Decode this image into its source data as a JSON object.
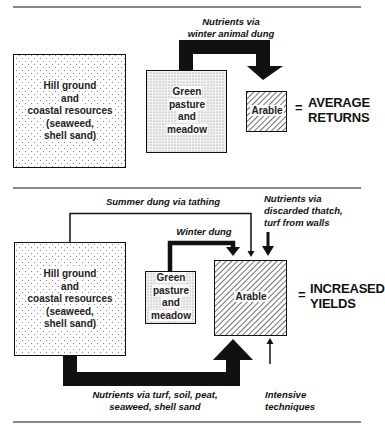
{
  "colors": {
    "ink": "#111111",
    "background": "#ffffff",
    "stipple": "#7a7a7a",
    "hatch": "#222222"
  },
  "top_panel": {
    "hill_box": {
      "lines": [
        "Hill ground",
        "and",
        "coastal resources",
        "(seaweed,",
        "shell sand)"
      ]
    },
    "pasture_box": {
      "lines": [
        "Green",
        "pasture",
        "and",
        "meadow"
      ]
    },
    "arable_box": {
      "label": "Arable"
    },
    "flow_label": {
      "lines": [
        "Nutrients via",
        "winter animal dung"
      ]
    },
    "equals": "=",
    "result": {
      "lines": [
        "AVERAGE",
        "RETURNS"
      ]
    }
  },
  "bottom_panel": {
    "hill_box": {
      "lines": [
        "Hill ground",
        "and",
        "coastal resources",
        "(seaweed,",
        "shell sand)"
      ]
    },
    "pasture_box": {
      "lines": [
        "Green",
        "pasture",
        "and",
        "meadow"
      ]
    },
    "arable_box": {
      "label": "Arable"
    },
    "summer_label": "Summer dung via tathing",
    "winter_label": "Winter dung",
    "thatch_label": {
      "lines": [
        "Nutrients via",
        "discarded thatch,",
        "turf from walls"
      ]
    },
    "turf_label": {
      "lines": [
        "Nutrients via turf, soil, peat,",
        "seaweed, shell sand"
      ]
    },
    "intensive_label": {
      "lines": [
        "Intensive",
        "techniques"
      ]
    },
    "equals": "=",
    "result": {
      "lines": [
        "INCREASED",
        "YIELDS"
      ]
    }
  }
}
